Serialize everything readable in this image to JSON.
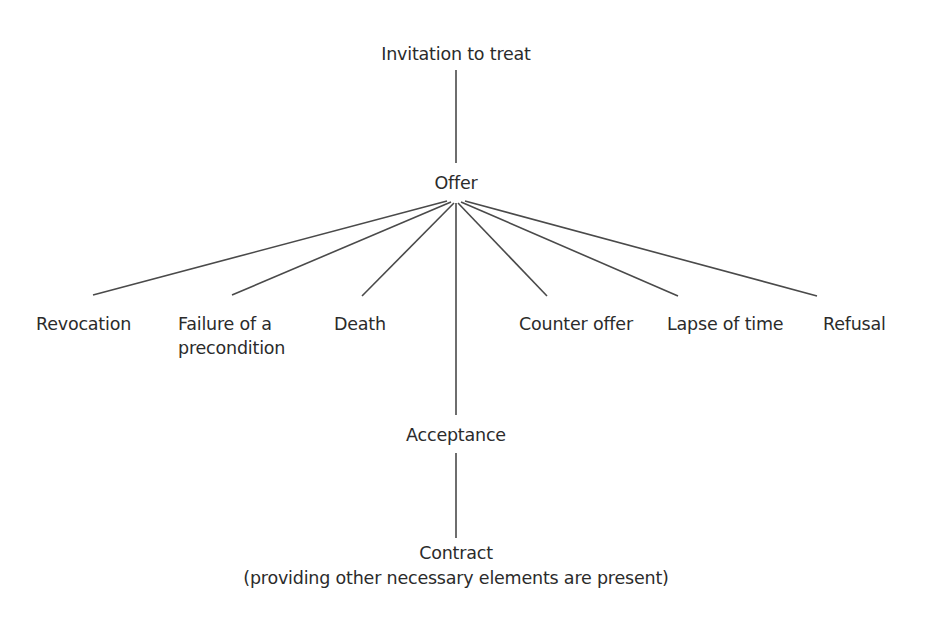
{
  "diagram": {
    "type": "tree",
    "nodes": {
      "invitation": {
        "label": "Invitation to treat"
      },
      "offer": {
        "label": "Offer"
      },
      "revocation": {
        "label": "Revocation"
      },
      "failure_line1": {
        "label": "Failure of a"
      },
      "failure_line2": {
        "label": "precondition"
      },
      "death": {
        "label": "Death"
      },
      "counter_offer": {
        "label": "Counter offer"
      },
      "lapse": {
        "label": "Lapse of time"
      },
      "refusal": {
        "label": "Refusal"
      },
      "acceptance": {
        "label": "Acceptance"
      },
      "contract": {
        "label": "Contract"
      },
      "contract_note": {
        "label": "(providing other necessary elements are present)"
      }
    },
    "edges": [
      {
        "from": "Invitation to treat",
        "to": "Offer"
      },
      {
        "from": "Offer",
        "to": "Revocation"
      },
      {
        "from": "Offer",
        "to": "Failure of a precondition"
      },
      {
        "from": "Offer",
        "to": "Death"
      },
      {
        "from": "Offer",
        "to": "Acceptance"
      },
      {
        "from": "Offer",
        "to": "Counter offer"
      },
      {
        "from": "Offer",
        "to": "Lapse of time"
      },
      {
        "from": "Offer",
        "to": "Refusal"
      },
      {
        "from": "Acceptance",
        "to": "Contract"
      }
    ],
    "colors": {
      "text": "#2b2b2b",
      "line": "#4a4a4a",
      "background": "#ffffff"
    }
  }
}
